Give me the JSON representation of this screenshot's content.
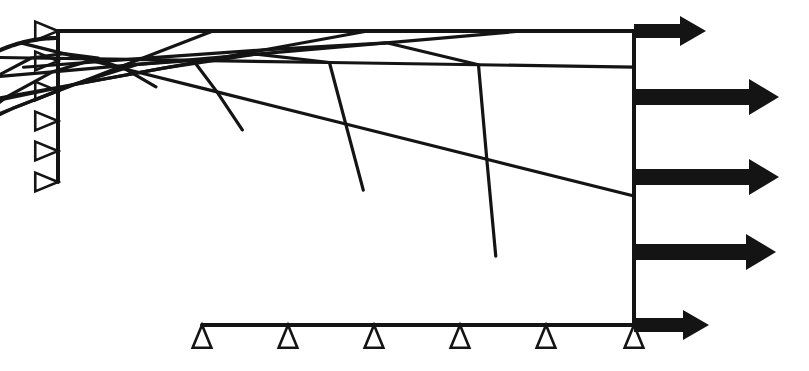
{
  "figure": {
    "kind": "finite-element-mesh-diagram",
    "background_color": "#ffffff",
    "line_color": "#141414"
  },
  "canvas": {
    "width": 809,
    "height": 371
  },
  "geometry": {
    "hole": {
      "center_x": 58,
      "center_y": 182,
      "radius": 144,
      "start_angle_deg": 180,
      "end_angle_deg": 90,
      "note": "quarter arc from left edge sweeping down to bottom edge"
    },
    "outer_boundary": {
      "left_x": 58,
      "right_x": 634,
      "top_y": 31,
      "bottom_y": 325,
      "left_edge_from_y": 31,
      "left_edge_to_y": 182,
      "bottom_edge_from_x": 202,
      "bottom_edge_to_x": 634
    },
    "mesh": {
      "radial_divisions": 6,
      "circumferential_divisions": 6,
      "radial_grading": [
        0,
        0.07,
        0.17,
        0.32,
        0.53,
        0.76,
        1.0
      ],
      "circumferential_fractions": [
        0,
        0.1667,
        0.3333,
        0.5,
        0.6667,
        0.8333,
        1.0
      ],
      "outer_corner_fraction": 0.62,
      "outer_corner_x": 634,
      "outer_corner_y": 31
    }
  },
  "supports": {
    "left": {
      "label": "roller supports on left symmetry edge",
      "count": 6,
      "orientation": "apex-right",
      "edge_x": 58,
      "size": 13,
      "y_positions": [
        31,
        61,
        91,
        121,
        151,
        182
      ]
    },
    "bottom": {
      "label": "roller supports on bottom symmetry edge",
      "count": 6,
      "orientation": "apex-up",
      "edge_y": 325,
      "size": 13,
      "x_positions": [
        202,
        288,
        374,
        460,
        546,
        634
      ]
    }
  },
  "loads": {
    "label": "uniform tensile traction on right edge",
    "direction": "right",
    "anchor_x": 634,
    "arrows": [
      {
        "y": 31,
        "tip_x": 706,
        "shaft_thickness": 14,
        "head_length": 26,
        "head_half_width": 15
      },
      {
        "y": 97,
        "tip_x": 779,
        "shaft_thickness": 16,
        "head_length": 30,
        "head_half_width": 18
      },
      {
        "y": 177,
        "tip_x": 779,
        "shaft_thickness": 16,
        "head_length": 30,
        "head_half_width": 18
      },
      {
        "y": 252,
        "tip_x": 776,
        "shaft_thickness": 16,
        "head_length": 30,
        "head_half_width": 18
      },
      {
        "y": 325,
        "tip_x": 709,
        "shaft_thickness": 14,
        "head_length": 26,
        "head_half_width": 15
      }
    ]
  }
}
